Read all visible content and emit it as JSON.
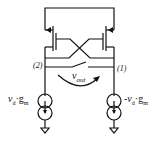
{
  "diagram": {
    "type": "circuit-schematic",
    "nodes": [
      {
        "id": "node-2",
        "label": "(2)"
      },
      {
        "id": "node-1",
        "label": "(1)"
      }
    ],
    "output_label": {
      "symbol": "v",
      "subscript": "out"
    },
    "sources": [
      {
        "id": "left-source",
        "sign": "",
        "var": "v",
        "var_sub": "d",
        "dot": "·",
        "g": "g",
        "g_sub": "m"
      },
      {
        "id": "right-source",
        "sign": "-",
        "var": "v",
        "var_sub": "d",
        "dot": "·",
        "g": "g",
        "g_sub": "m"
      }
    ],
    "colors": {
      "stroke": "#111111",
      "background": "#ffffff"
    }
  }
}
